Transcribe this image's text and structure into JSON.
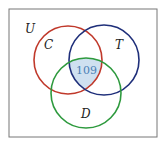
{
  "diagram": {
    "type": "venn",
    "universe_label": "U",
    "sets": [
      {
        "label": "C",
        "color": "#c0392b"
      },
      {
        "label": "T",
        "color": "#1f2f7a"
      },
      {
        "label": "D",
        "color": "#2e9a3e"
      }
    ],
    "regions": [
      {
        "sets": [
          "C",
          "T",
          "D"
        ],
        "value": "109",
        "fill": "#cfe0f0"
      }
    ]
  }
}
